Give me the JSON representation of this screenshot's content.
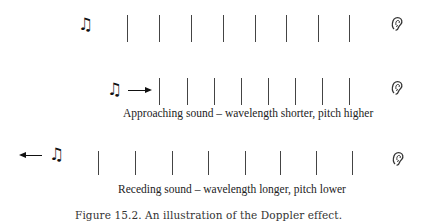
{
  "figure": {
    "caption": "Figure 15.2.   An illustration of the Doppler effect."
  },
  "rows": [
    {
      "id": "stationary",
      "label": "",
      "source_icon": "music-note-icon",
      "listener_icon": "ear-icon",
      "motion": "none",
      "wavefront_x": [
        127,
        159,
        191,
        223,
        255,
        286,
        318,
        349
      ]
    },
    {
      "id": "approaching",
      "label": "Approaching sound – wavelength shorter, pitch higher",
      "source_icon": "music-note-icon",
      "listener_icon": "ear-icon",
      "motion": "toward-listener",
      "wavefront_x": [
        159,
        187,
        214,
        241,
        268,
        295,
        322,
        349
      ]
    },
    {
      "id": "receding",
      "label": "Receding sound – wavelength longer, pitch lower",
      "source_icon": "music-note-icon",
      "listener_icon": "ear-icon",
      "motion": "away-from-listener",
      "wavefront_x": [
        98,
        135,
        172,
        208,
        245,
        280,
        316,
        352
      ]
    }
  ],
  "glyphs": {
    "note": "♫"
  },
  "colors": {
    "wavefront": "#444444",
    "text": "#222222",
    "background": "#ffffff"
  }
}
